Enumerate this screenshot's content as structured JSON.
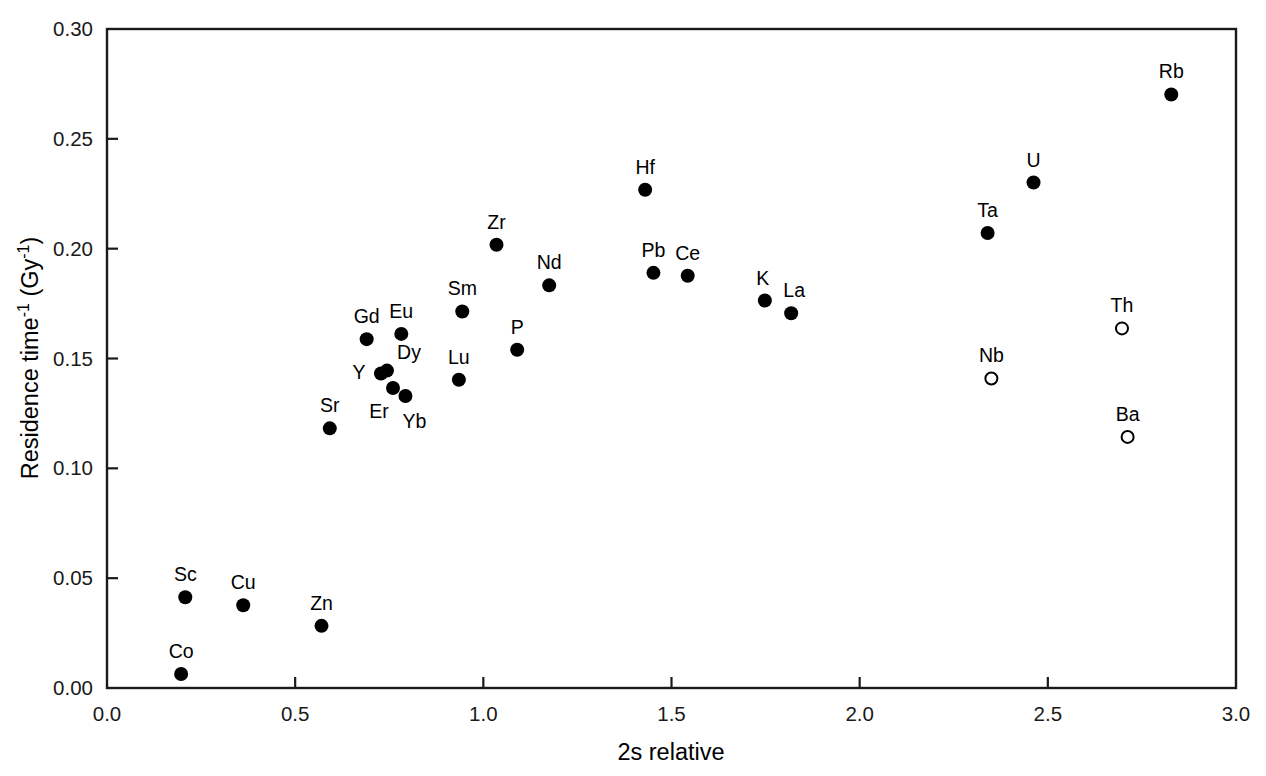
{
  "chart_data": {
    "type": "scatter",
    "title": "",
    "xlabel": "2s relative",
    "ylabel": "Residence time ⁻¹ (Gy⁻¹)",
    "ylabel_parts": {
      "main": "Residence time",
      "exp1": "-1",
      "unit_open": " (Gy",
      "exp2": "-1",
      "unit_close": ")"
    },
    "xlim": [
      0.0,
      3.0
    ],
    "ylim": [
      0.0,
      0.3
    ],
    "xticks": [
      "0.0",
      "0.5",
      "1.0",
      "1.5",
      "2.0",
      "2.5",
      "3.0"
    ],
    "xtick_values": [
      0.0,
      0.5,
      1.0,
      1.5,
      2.0,
      2.5,
      3.0
    ],
    "yticks": [
      "0.00",
      "0.05",
      "0.10",
      "0.15",
      "0.20",
      "0.25",
      "0.30"
    ],
    "ytick_values": [
      0.0,
      0.05,
      0.1,
      0.15,
      0.2,
      0.25,
      0.3
    ],
    "grid": false,
    "legend": "none",
    "marker_styles": [
      "filled",
      "open"
    ],
    "points": [
      {
        "label": "Co",
        "x": 0.197,
        "y": 0.0064,
        "marker": "filled",
        "label_dx": 0,
        "label_dy": -16
      },
      {
        "label": "Sc",
        "x": 0.208,
        "y": 0.0413,
        "marker": "filled",
        "label_dx": 0,
        "label_dy": -16
      },
      {
        "label": "Cu",
        "x": 0.362,
        "y": 0.0377,
        "marker": "filled",
        "label_dx": 0,
        "label_dy": -16
      },
      {
        "label": "Zn",
        "x": 0.57,
        "y": 0.0283,
        "marker": "filled",
        "label_dx": 0,
        "label_dy": -16
      },
      {
        "label": "Sr",
        "x": 0.592,
        "y": 0.1182,
        "marker": "filled",
        "label_dx": 0,
        "label_dy": -16
      },
      {
        "label": "Gd",
        "x": 0.69,
        "y": 0.1588,
        "marker": "filled",
        "label_dx": 0,
        "label_dy": -16
      },
      {
        "label": "Y",
        "x": 0.728,
        "y": 0.1432,
        "marker": "filled",
        "label_dx": -22,
        "label_dy": 6
      },
      {
        "label": "Dy",
        "x": 0.744,
        "y": 0.1445,
        "marker": "filled",
        "label_dx": 22,
        "label_dy": -12
      },
      {
        "label": "Er",
        "x": 0.76,
        "y": 0.1366,
        "marker": "filled",
        "label_dx": -14,
        "label_dy": 30
      },
      {
        "label": "Eu",
        "x": 0.782,
        "y": 0.1612,
        "marker": "filled",
        "label_dx": 0,
        "label_dy": -16
      },
      {
        "label": "Yb",
        "x": 0.793,
        "y": 0.1329,
        "marker": "filled",
        "label_dx": 9,
        "label_dy": 32
      },
      {
        "label": "Lu",
        "x": 0.935,
        "y": 0.1403,
        "marker": "filled",
        "label_dx": 0,
        "label_dy": -16
      },
      {
        "label": "Sm",
        "x": 0.944,
        "y": 0.1714,
        "marker": "filled",
        "label_dx": 0,
        "label_dy": -16
      },
      {
        "label": "Zr",
        "x": 1.035,
        "y": 0.2018,
        "marker": "filled",
        "label_dx": 0,
        "label_dy": -16
      },
      {
        "label": "P",
        "x": 1.09,
        "y": 0.154,
        "marker": "filled",
        "label_dx": 0,
        "label_dy": -16
      },
      {
        "label": "Nd",
        "x": 1.175,
        "y": 0.1833,
        "marker": "filled",
        "label_dx": 0,
        "label_dy": -16
      },
      {
        "label": "Hf",
        "x": 1.43,
        "y": 0.2268,
        "marker": "filled",
        "label_dx": 0,
        "label_dy": -16
      },
      {
        "label": "Pb",
        "x": 1.452,
        "y": 0.189,
        "marker": "filled",
        "label_dx": 0,
        "label_dy": -16
      },
      {
        "label": "Ce",
        "x": 1.543,
        "y": 0.1877,
        "marker": "filled",
        "label_dx": 0,
        "label_dy": -16
      },
      {
        "label": "K",
        "x": 1.748,
        "y": 0.1764,
        "marker": "filled",
        "label_dx": -2,
        "label_dy": -16
      },
      {
        "label": "La",
        "x": 1.818,
        "y": 0.1706,
        "marker": "filled",
        "label_dx": 3,
        "label_dy": -16
      },
      {
        "label": "Ta",
        "x": 2.34,
        "y": 0.2071,
        "marker": "filled",
        "label_dx": 0,
        "label_dy": -16
      },
      {
        "label": "Nb",
        "x": 2.35,
        "y": 0.1409,
        "marker": "open",
        "label_dx": 0,
        "label_dy": -16
      },
      {
        "label": "U",
        "x": 2.462,
        "y": 0.2301,
        "marker": "filled",
        "label_dx": 0,
        "label_dy": -16
      },
      {
        "label": "Th",
        "x": 2.697,
        "y": 0.1637,
        "marker": "open",
        "label_dx": 0,
        "label_dy": -16
      },
      {
        "label": "Ba",
        "x": 2.712,
        "y": 0.1143,
        "marker": "open",
        "label_dx": 0,
        "label_dy": -16
      },
      {
        "label": "Rb",
        "x": 2.828,
        "y": 0.2702,
        "marker": "filled",
        "label_dx": 0,
        "label_dy": -16
      }
    ]
  }
}
